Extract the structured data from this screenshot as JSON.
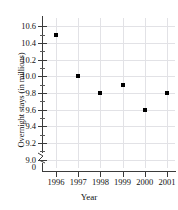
{
  "chart_data": {
    "type": "scatter",
    "title": "",
    "xlabel": "Year",
    "ylabel": "Overnight stays (in millions)",
    "categories": [
      "1996",
      "1997",
      "1998",
      "1999",
      "2000",
      "2001"
    ],
    "x": [
      1996,
      1997,
      1998,
      1999,
      2000,
      2001
    ],
    "values": [
      10.5,
      10.0,
      9.8,
      9.9,
      9.6,
      9.8
    ],
    "series": [
      {
        "name": "Overnight stays",
        "values": [
          10.5,
          10.0,
          9.8,
          9.9,
          9.6,
          9.8
        ]
      }
    ],
    "points": [
      {
        "x": "1996",
        "y": 10.5
      },
      {
        "x": "1997",
        "y": 10.0
      },
      {
        "x": "1998",
        "y": 9.8
      },
      {
        "x": "1999",
        "y": 9.9
      },
      {
        "x": "2000",
        "y": 9.6
      },
      {
        "x": "2001",
        "y": 9.8
      }
    ],
    "ylim": [
      8.9,
      10.7
    ],
    "xlim": [
      1995.5,
      2001.5
    ],
    "y_ticks": [
      "0",
      "9.0",
      "9.2",
      "9.4",
      "9.6",
      "9.8",
      "10.0",
      "10.2",
      "10.4",
      "10.6"
    ],
    "y_tick_values": [
      9.0,
      9.2,
      9.4,
      9.6,
      9.8,
      10.0,
      10.2,
      10.4,
      10.6
    ],
    "y_minor_step": 0.1,
    "origin_label": "0",
    "axis_break": true,
    "grid": true,
    "legend": "none",
    "marker": "square",
    "marker_color": "#000000",
    "grid_color": "#e2e2e6",
    "axis_color": "#3b3b3b"
  }
}
